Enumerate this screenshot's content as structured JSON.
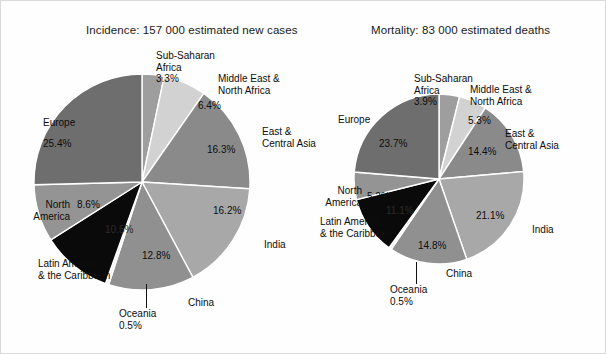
{
  "figure": {
    "background_color": "#fefefe",
    "border_color": "#d9d9d9"
  },
  "charts": [
    {
      "id": "incidence",
      "title": "Incidence: 157 000 estimated new cases",
      "labels": {
        "sub_saharan_africa": "Sub-Saharan\nAfrica",
        "sub_saharan_africa_pct": "3.3%",
        "middle_east_north_africa": "Middle East &\nNorth Africa",
        "middle_east_north_africa_pct": "6.4%",
        "east_central_asia": "East &\nCentral Asia",
        "east_central_asia_pct": "16.3%",
        "india": "India",
        "india_pct": "16.2%",
        "china": "China",
        "china_pct": "12.8%",
        "oceania": "Oceania\n0.5%",
        "latin_america": "Latin America\n& the Caribbean",
        "latin_america_pct": "10.5%",
        "north_america": "North\nAmerica",
        "north_america_pct": "8.6%",
        "europe": "Europe",
        "europe_pct": "25.4%"
      }
    },
    {
      "id": "mortality",
      "title": "Mortality: 83 000 estimated deaths",
      "labels": {
        "sub_saharan_africa": "Sub-Saharan\nAfrica",
        "sub_saharan_africa_pct": "3.9%",
        "middle_east_north_africa": "Middle East &\nNorth Africa",
        "middle_east_north_africa_pct": "5.3%",
        "east_central_asia": "East &\nCentral Asia",
        "east_central_asia_pct": "14.4%",
        "india": "India",
        "india_pct": "21.1%",
        "china": "China",
        "china_pct": "14.8%",
        "oceania": "Oceania\n0.5%",
        "latin_america": "Latin America\n& the Caribbean",
        "latin_america_pct": "11.1%",
        "north_america": "North\nAmerica",
        "north_america_pct": "5.2%",
        "europe": "Europe",
        "europe_pct": "23.7%"
      }
    }
  ],
  "chart_data": [
    {
      "type": "pie",
      "id": "incidence",
      "title": "Incidence: 157 000 estimated new cases",
      "total_label": "157 000 estimated new cases",
      "total_value": 157000,
      "unit": "new cases",
      "start_angle_deg": 0,
      "direction": "clockwise",
      "categories": [
        "Sub-Saharan Africa",
        "Middle East & North Africa",
        "East & Central Asia",
        "India",
        "China",
        "Oceania",
        "Latin America & the Caribbean",
        "North America",
        "Europe"
      ],
      "values": [
        3.3,
        6.4,
        16.3,
        16.2,
        12.8,
        0.5,
        10.5,
        8.6,
        25.4
      ],
      "value_labels": [
        "3.3%",
        "6.4%",
        "16.3%",
        "16.2%",
        "12.8%",
        "0.5%",
        "10.5%",
        "8.6%",
        "25.4%"
      ],
      "colors": [
        "#9e9e9e",
        "#d2d2d2",
        "#8a8a8a",
        "#a8a8a8",
        "#909090",
        "#f2f2f2",
        "#0a0a0a",
        "#949494",
        "#6e6e6e"
      ],
      "slice_border_color": "#ffffff",
      "sum": 100.0,
      "legend": "none (direct labels)"
    },
    {
      "type": "pie",
      "id": "mortality",
      "title": "Mortality: 83 000 estimated deaths",
      "total_label": "83 000 estimated deaths",
      "total_value": 83000,
      "unit": "deaths",
      "start_angle_deg": 0,
      "direction": "clockwise",
      "categories": [
        "Sub-Saharan Africa",
        "Middle East & North Africa",
        "East & Central Asia",
        "India",
        "China",
        "Oceania",
        "Latin America & the Caribbean",
        "North America",
        "Europe"
      ],
      "values": [
        3.9,
        5.3,
        14.4,
        21.1,
        14.8,
        0.5,
        11.1,
        5.2,
        23.7
      ],
      "value_labels": [
        "3.9%",
        "5.3%",
        "14.4%",
        "21.1%",
        "14.8%",
        "0.5%",
        "11.1%",
        "5.2%",
        "23.7%"
      ],
      "colors": [
        "#9e9e9e",
        "#d2d2d2",
        "#8a8a8a",
        "#a8a8a8",
        "#909090",
        "#f2f2f2",
        "#0a0a0a",
        "#949494",
        "#6e6e6e"
      ],
      "slice_border_color": "#ffffff",
      "sum": 100.0,
      "legend": "none (direct labels)"
    }
  ]
}
